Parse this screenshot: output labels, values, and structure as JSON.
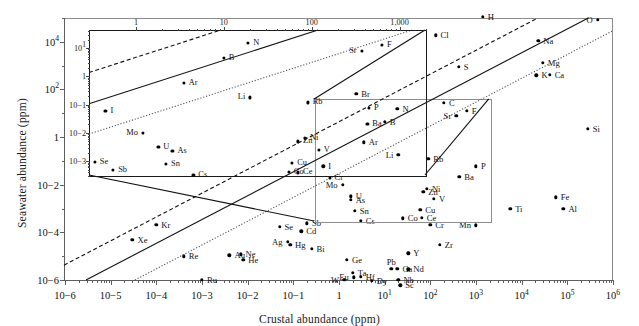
{
  "chart_data": {
    "type": "scatter",
    "title": "",
    "xlabel": "Crustal abundance (ppm)",
    "ylabel": "Seawater abundance (ppm)",
    "xscale": "log",
    "yscale": "log",
    "xlim": [
      1e-06,
      1000000.0
    ],
    "ylim": [
      1e-06,
      100000.0
    ],
    "grid": false,
    "legend": "none",
    "xticks": [
      "10−6",
      "10−5",
      "10−4",
      "10−3",
      "10−2",
      "10−1",
      "1",
      "10¹",
      "10²",
      "10³",
      "10⁴",
      "10⁵",
      "10⁶"
    ],
    "yticks": [
      "10⁴",
      "10²",
      "1",
      "10−2",
      "10−4",
      "10−6"
    ],
    "annotations": [
      "dashed reference line",
      "solid reference line",
      "dotted reference line",
      "inset magnifier of central region"
    ],
    "points": [
      {
        "label": "O",
        "x": 460000.0,
        "y": 86000.0
      },
      {
        "label": "H",
        "x": 1400.0,
        "y": 110000.0
      },
      {
        "label": "Cl",
        "x": 130.0,
        "y": 19000.0
      },
      {
        "label": "Na",
        "x": 23000.0,
        "y": 11000.0
      },
      {
        "label": "Mg",
        "x": 29000.0,
        "y": 1300.0
      },
      {
        "label": "K",
        "x": 21000.0,
        "y": 390.0
      },
      {
        "label": "Ca",
        "x": 41000.0,
        "y": 410.0
      },
      {
        "label": "S",
        "x": 420.0,
        "y": 900.0
      },
      {
        "label": "Br",
        "x": 2.4,
        "y": 67.0
      },
      {
        "label": "C",
        "x": 200.0,
        "y": 28.0
      },
      {
        "label": "N",
        "x": 19.0,
        "y": 15.0
      },
      {
        "label": "Sr",
        "x": 370.0,
        "y": 8.0
      },
      {
        "label": "F",
        "x": 630.0,
        "y": 13.0
      },
      {
        "label": "B",
        "x": 10.0,
        "y": 4.4
      },
      {
        "label": "Si",
        "x": 280000.0,
        "y": 2.2
      },
      {
        "label": "Ar",
        "x": 3.5,
        "y": 0.6
      },
      {
        "label": "Li",
        "x": 20.0,
        "y": 0.18
      },
      {
        "label": "Rb",
        "x": 90.0,
        "y": 0.12
      },
      {
        "label": "P",
        "x": 1000.0,
        "y": 0.06
      },
      {
        "label": "I",
        "x": 0.45,
        "y": 0.06
      },
      {
        "label": "Ba",
        "x": 430.0,
        "y": 0.021
      },
      {
        "label": "Mo",
        "x": 1.2,
        "y": 0.01
      },
      {
        "label": "Ni",
        "x": 84.0,
        "y": 0.0066
      },
      {
        "label": "Zn",
        "x": 70.0,
        "y": 0.005
      },
      {
        "label": "V",
        "x": 120.0,
        "y": 0.0025
      },
      {
        "label": "U",
        "x": 1.8,
        "y": 0.0033
      },
      {
        "label": "As",
        "x": 1.8,
        "y": 0.0023
      },
      {
        "label": "Cu",
        "x": 60.0,
        "y": 0.0009
      },
      {
        "label": "Sn",
        "x": 2.2,
        "y": 0.00081
      },
      {
        "label": "Co",
        "x": 25.0,
        "y": 0.00039
      },
      {
        "label": "Ce",
        "x": 65.0,
        "y": 0.0004
      },
      {
        "label": "Cs",
        "x": 3.0,
        "y": 0.0003
      },
      {
        "label": "Cr",
        "x": 100.0,
        "y": 0.00021
      },
      {
        "label": "Mn",
        "x": 1000.0,
        "y": 0.0002
      },
      {
        "label": "Fe",
        "x": 56000.0,
        "y": 0.003
      },
      {
        "label": "Al",
        "x": 82000.0,
        "y": 0.001
      },
      {
        "label": "Ti",
        "x": 5600.0,
        "y": 0.001
      },
      {
        "label": "Se",
        "x": 0.05,
        "y": 0.00017
      },
      {
        "label": "Sb",
        "x": 0.2,
        "y": 0.00024
      },
      {
        "label": "Ag",
        "x": 0.075,
        "y": 4e-05
      },
      {
        "label": "Hg",
        "x": 0.085,
        "y": 3e-05
      },
      {
        "label": "Cd",
        "x": 0.15,
        "y": 0.00011
      },
      {
        "label": "Kr",
        "x": 0.0001,
        "y": 0.00021
      },
      {
        "label": "Xe",
        "x": 3e-05,
        "y": 5e-05
      },
      {
        "label": "Y",
        "x": 33.0,
        "y": 1.3e-05
      },
      {
        "label": "Ge",
        "x": 1.5,
        "y": 7e-06
      },
      {
        "label": "Pb",
        "x": 14.0,
        "y": 3e-06
      },
      {
        "label": "Ga",
        "x": 19.0,
        "y": 3e-06
      },
      {
        "label": "Nb",
        "x": 20.0,
        "y": 1e-06
      },
      {
        "label": "Hf",
        "x": 3.0,
        "y": 1.4e-06
      },
      {
        "label": "Zr",
        "x": 160.0,
        "y": 3e-05
      },
      {
        "label": "Nd",
        "x": 33.0,
        "y": 2.8e-06
      },
      {
        "label": "Bi",
        "x": 0.25,
        "y": 2e-05
      },
      {
        "label": "Sc",
        "x": 22.0,
        "y": 6e-07
      },
      {
        "label": "Ta",
        "x": 2.0,
        "y": 2e-06
      },
      {
        "label": "W",
        "x": 1.3,
        "y": 1e-06
      },
      {
        "label": "Eu",
        "x": 2.1,
        "y": 1.3e-06
      },
      {
        "label": "Dy",
        "x": 5.2,
        "y": 9.1e-07
      },
      {
        "label": "Au",
        "x": 0.004,
        "y": 1.1e-05
      },
      {
        "label": "Ne",
        "x": 0.007,
        "y": 1.2e-05
      },
      {
        "label": "He",
        "x": 0.008,
        "y": 7e-06
      },
      {
        "label": "Re",
        "x": 0.0004,
        "y": 1e-05
      },
      {
        "label": "Ru",
        "x": 0.001,
        "y": 1e-06
      }
    ],
    "inset": {
      "type": "scatter",
      "note": "magnified view of boxed region",
      "xscale": "log",
      "yscale": "log",
      "xlim": [
        0.3,
        2000
      ],
      "ylim": [
        0.0003,
        40
      ],
      "xticks": [
        "1",
        "10",
        "100",
        "1,000"
      ],
      "yticks": [
        "10¹",
        "1",
        "10−1",
        "10−2",
        "10−3"
      ],
      "points": [
        {
          "label": "N",
          "x": 19.0,
          "y": 15.0
        },
        {
          "label": "B",
          "x": 10.0,
          "y": 4.4
        },
        {
          "label": "Sr",
          "x": 370.0,
          "y": 8.0
        },
        {
          "label": "F",
          "x": 630.0,
          "y": 13.0
        },
        {
          "label": "Ar",
          "x": 3.5,
          "y": 0.6
        },
        {
          "label": "Li",
          "x": 20.0,
          "y": 0.18
        },
        {
          "label": "Rb",
          "x": 90.0,
          "y": 0.12
        },
        {
          "label": "P",
          "x": 450.0,
          "y": 0.075
        },
        {
          "label": "I",
          "x": 0.45,
          "y": 0.06
        },
        {
          "label": "Ba",
          "x": 430.0,
          "y": 0.021
        },
        {
          "label": "Mo",
          "x": 1.2,
          "y": 0.01
        },
        {
          "label": "Ni",
          "x": 84.0,
          "y": 0.0066
        },
        {
          "label": "Zn",
          "x": 70.0,
          "y": 0.005
        },
        {
          "label": "V",
          "x": 120.0,
          "y": 0.0025
        },
        {
          "label": "U",
          "x": 1.8,
          "y": 0.0033
        },
        {
          "label": "As",
          "x": 2.6,
          "y": 0.0023
        },
        {
          "label": "Cu",
          "x": 60.0,
          "y": 0.0009
        },
        {
          "label": "Sn",
          "x": 2.2,
          "y": 0.00081
        },
        {
          "label": "Co",
          "x": 55.0,
          "y": 0.00043
        },
        {
          "label": "Ce",
          "x": 70.0,
          "y": 0.0004
        },
        {
          "label": "Cs",
          "x": 4.5,
          "y": 0.00032
        },
        {
          "label": "Cr",
          "x": 160.0,
          "y": 0.00026
        },
        {
          "label": "Se",
          "x": 0.34,
          "y": 0.00095
        },
        {
          "label": "Sb",
          "x": 0.55,
          "y": 0.0005
        }
      ]
    }
  }
}
